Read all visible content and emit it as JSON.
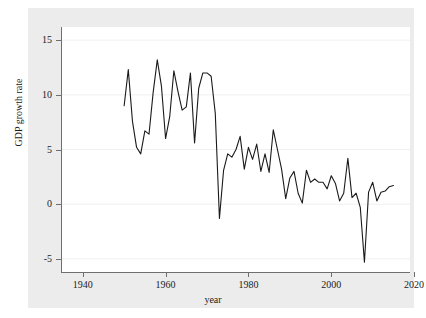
{
  "chart_data": {
    "type": "line",
    "title": "",
    "xlabel": "year",
    "ylabel": "GDP growth rate",
    "xlim": [
      1935,
      2019
    ],
    "ylim": [
      -6.2,
      16.2
    ],
    "xticks": [
      1940,
      1960,
      1980,
      2000,
      2020
    ],
    "xtick_labels": [
      "1940",
      "1960",
      "1980",
      "2000",
      "2020"
    ],
    "yticks": [
      -5,
      0,
      5,
      10,
      15
    ],
    "ytick_labels": [
      "-5",
      "0",
      "5",
      "10",
      "15"
    ],
    "grid": true,
    "grid_axis": "y",
    "legend": "none",
    "line_color": "#1a1a1a",
    "line_width": 1.1,
    "plot_background": "#ffffff",
    "figure_background": "#ececec",
    "series": [
      {
        "name": "GDP growth rate",
        "x": [
          1950,
          1951,
          1952,
          1953,
          1954,
          1955,
          1956,
          1957,
          1958,
          1959,
          1960,
          1961,
          1962,
          1963,
          1964,
          1965,
          1966,
          1967,
          1968,
          1969,
          1970,
          1971,
          1972,
          1973,
          1974,
          1975,
          1976,
          1977,
          1978,
          1979,
          1980,
          1981,
          1982,
          1983,
          1984,
          1985,
          1986,
          1987,
          1988,
          1989,
          1990,
          1991,
          1992,
          1993,
          1994,
          1995,
          1996,
          1997,
          1998,
          1999,
          2000,
          2001,
          2002,
          2003,
          2004,
          2005,
          2006,
          2007,
          2008,
          2009,
          2010,
          2011,
          2012,
          2013,
          2014,
          2015
        ],
        "values": [
          9.0,
          12.3,
          7.6,
          5.2,
          4.6,
          6.7,
          6.4,
          10.2,
          13.2,
          10.8,
          6.0,
          8.0,
          12.2,
          10.3,
          8.6,
          8.9,
          12.0,
          5.6,
          10.6,
          12.0,
          12.0,
          11.7,
          8.3,
          -1.3,
          3.1,
          4.6,
          4.3,
          5.0,
          6.2,
          3.2,
          5.2,
          4.1,
          5.5,
          3.0,
          4.6,
          2.9,
          6.8,
          5.0,
          3.2,
          0.5,
          2.4,
          3.0,
          1.0,
          0.1,
          3.1,
          2.0,
          2.3,
          2.0,
          2.0,
          1.4,
          2.6,
          1.9,
          0.3,
          1.0,
          4.2,
          0.6,
          1.0,
          -0.3,
          -5.3,
          1.1,
          2.0,
          0.3,
          1.1,
          1.2,
          1.6,
          1.7
        ]
      }
    ]
  },
  "axes": {
    "x_title": "year",
    "y_title": "GDP growth rate"
  }
}
